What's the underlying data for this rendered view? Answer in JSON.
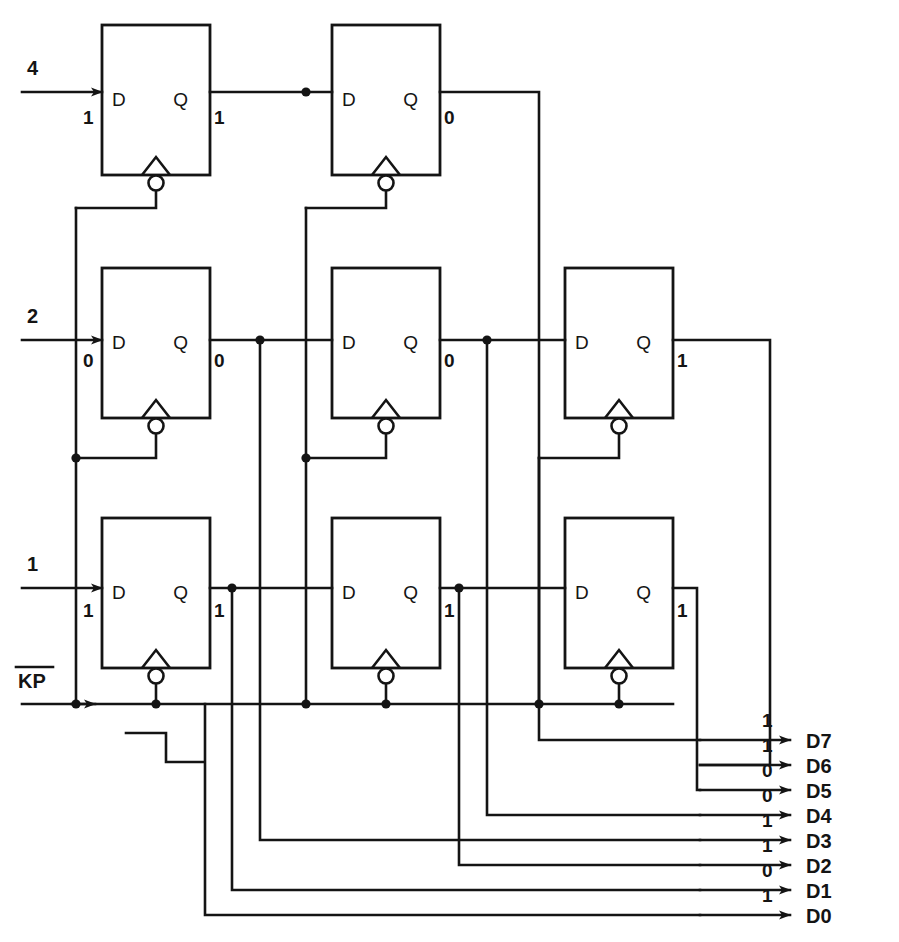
{
  "diagram": {
    "type": "digital-logic-schematic",
    "line_color": "#141414",
    "background": "#ffffff"
  },
  "inputs": [
    {
      "name": "in-4",
      "label": "4",
      "bit": "1",
      "row": "top"
    },
    {
      "name": "in-2",
      "label": "2",
      "bit": "0",
      "row": "middle"
    },
    {
      "name": "in-1",
      "label": "1",
      "bit": "1",
      "row": "bottom"
    }
  ],
  "clock": {
    "label": "KP",
    "overbar": true,
    "active": "low",
    "edge": "falling",
    "waveform_name": "falling-edge-symbol"
  },
  "flipflops": [
    {
      "id": "ff-r1c1",
      "row": 1,
      "col": 1,
      "d_pin": "D",
      "q_pin": "Q",
      "d_bit": "1",
      "q_bit": "1"
    },
    {
      "id": "ff-r1c2",
      "row": 1,
      "col": 2,
      "d_pin": "D",
      "q_pin": "Q",
      "d_bit": "",
      "q_bit": "0"
    },
    {
      "id": "ff-r2c1",
      "row": 2,
      "col": 1,
      "d_pin": "D",
      "q_pin": "Q",
      "d_bit": "0",
      "q_bit": "0"
    },
    {
      "id": "ff-r2c2",
      "row": 2,
      "col": 2,
      "d_pin": "D",
      "q_pin": "Q",
      "d_bit": "",
      "q_bit": "0"
    },
    {
      "id": "ff-r2c3",
      "row": 2,
      "col": 3,
      "d_pin": "D",
      "q_pin": "Q",
      "d_bit": "",
      "q_bit": "1"
    },
    {
      "id": "ff-r3c1",
      "row": 3,
      "col": 1,
      "d_pin": "D",
      "q_pin": "Q",
      "d_bit": "1",
      "q_bit": "1"
    },
    {
      "id": "ff-r3c2",
      "row": 3,
      "col": 2,
      "d_pin": "D",
      "q_pin": "Q",
      "d_bit": "",
      "q_bit": "1"
    },
    {
      "id": "ff-r3c3",
      "row": 3,
      "col": 3,
      "d_pin": "D",
      "q_pin": "Q",
      "d_bit": "",
      "q_bit": "1"
    }
  ],
  "outputs": [
    {
      "name": "out-d7",
      "label": "D7",
      "bit": "1"
    },
    {
      "name": "out-d6",
      "label": "D6",
      "bit": "1"
    },
    {
      "name": "out-d5",
      "label": "D5",
      "bit": "0"
    },
    {
      "name": "out-d4",
      "label": "D4",
      "bit": "0"
    },
    {
      "name": "out-d3",
      "label": "D3",
      "bit": "1"
    },
    {
      "name": "out-d2",
      "label": "D2",
      "bit": "1"
    },
    {
      "name": "out-d1",
      "label": "D1",
      "bit": "0"
    },
    {
      "name": "out-d0",
      "label": "D0",
      "bit": "1"
    }
  ]
}
